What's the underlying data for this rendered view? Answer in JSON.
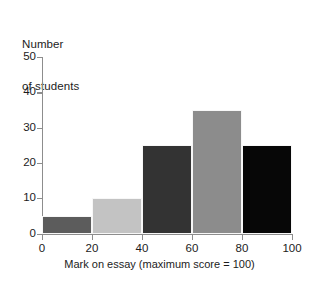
{
  "chart_data": {
    "type": "bar",
    "title": "",
    "subtitle": "",
    "xlabel": "Mark on essay (maximum score = 100)",
    "ylabel": "Number\nof students",
    "ylabel_lines": [
      "Number",
      "of students"
    ],
    "categories": [
      "0-20",
      "20-40",
      "40-60",
      "60-80",
      "80-100"
    ],
    "bin_edges": [
      0,
      20,
      40,
      60,
      80,
      100
    ],
    "values": [
      5,
      10,
      25,
      35,
      25
    ],
    "bar_colors": [
      "#5c5c5c",
      "#c3c3c3",
      "#333333",
      "#8c8c8c",
      "#070707"
    ],
    "xlim": [
      0,
      100
    ],
    "ylim": [
      0,
      50
    ],
    "xticks": [
      0,
      20,
      40,
      60,
      80,
      100
    ],
    "yticks": [
      0,
      10,
      20,
      30,
      40,
      50
    ],
    "xtick_labels": [
      "0",
      "20",
      "40",
      "60",
      "80",
      "100"
    ],
    "ytick_labels": [
      "0",
      "10",
      "20",
      "30",
      "40",
      "50"
    ],
    "grid": false,
    "legend": false,
    "legend_position": "none",
    "axis_color": "#8d8d8d",
    "text_color": "#1c1c1c",
    "background": "#ffffff"
  }
}
